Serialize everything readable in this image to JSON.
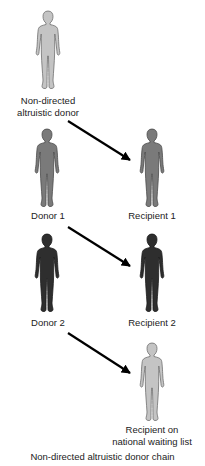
{
  "diagram": {
    "caption": "Non-directed altruistic donor chain",
    "colors": {
      "light_figure": "#c4c4c4",
      "light_outline": "#6f6f6f",
      "mid_figure": "#7a7a7a",
      "mid_outline": "#4a4a4a",
      "dark_figure": "#2e2e2e",
      "dark_outline": "#1a1a1a",
      "arrow": "#000000"
    },
    "nodes": {
      "ndad": {
        "line1": "Non-directed",
        "line2": "altruistic donor",
        "shade": "light"
      },
      "donor1": {
        "label": "Donor 1",
        "shade": "mid"
      },
      "recipient1": {
        "label": "Recipient 1",
        "shade": "mid"
      },
      "donor2": {
        "label": "Donor 2",
        "shade": "dark"
      },
      "recipient2": {
        "label": "Recipient 2",
        "shade": "dark"
      },
      "waitlist": {
        "line1": "Recipient on",
        "line2": "national waiting list",
        "shade": "light"
      }
    },
    "edges": [
      {
        "from": "Non-directed altruistic donor",
        "to": "Recipient 1"
      },
      {
        "from": "Donor 1",
        "to": "Recipient 2"
      },
      {
        "from": "Donor 2",
        "to": "Recipient on national waiting list"
      }
    ]
  }
}
